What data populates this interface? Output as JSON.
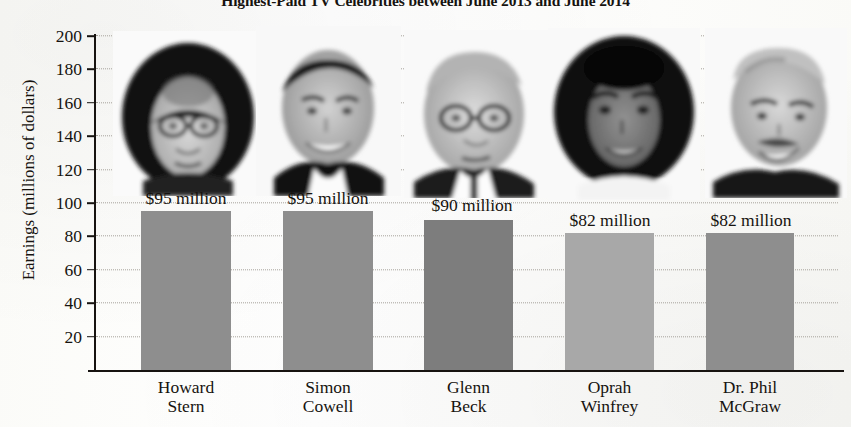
{
  "chart_data": {
    "type": "bar",
    "title": "Highest-Paid TV Celebrities between June 2013 and June 2014",
    "xlabel": "",
    "ylabel": "Earnings (millions of dollars)",
    "categories": [
      "Howard Stern",
      "Simon Cowell",
      "Glenn Beck",
      "Oprah Winfrey",
      "Dr. Phil McGraw"
    ],
    "category_lines": [
      [
        "Howard",
        "Stern"
      ],
      [
        "Simon",
        "Cowell"
      ],
      [
        "Glenn",
        "Beck"
      ],
      [
        "Oprah",
        "Winfrey"
      ],
      [
        "Dr. Phil",
        "McGraw"
      ]
    ],
    "values": [
      95,
      95,
      90,
      82,
      82
    ],
    "value_labels": [
      "$95 million",
      "$95 million",
      "$90 million",
      "$82 million",
      "$82 million"
    ],
    "ylim": [
      0,
      200
    ],
    "yticks": [
      20,
      40,
      60,
      80,
      100,
      120,
      140,
      160,
      180,
      200
    ],
    "ytick_labels": [
      "20",
      "40",
      "60",
      "80",
      "100",
      "120",
      "140",
      "160",
      "180",
      "200"
    ],
    "grid": "horizontal-dotted",
    "legend": "none",
    "bar_colors": [
      "#8e8e8e",
      "#8e8e8e",
      "#7d7d7d",
      "#a8a8a8",
      "#8e8e8e"
    ],
    "images": [
      {
        "name": "howard-stern-photo",
        "alt": "Howard Stern portrait"
      },
      {
        "name": "simon-cowell-photo",
        "alt": "Simon Cowell portrait"
      },
      {
        "name": "glenn-beck-photo",
        "alt": "Glenn Beck portrait"
      },
      {
        "name": "oprah-winfrey-photo",
        "alt": "Oprah Winfrey portrait"
      },
      {
        "name": "dr-phil-mcgraw-photo",
        "alt": "Dr. Phil McGraw portrait"
      }
    ]
  }
}
